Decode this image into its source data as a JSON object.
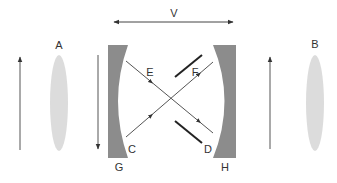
{
  "diagram": {
    "labels": {
      "velocity": "V",
      "lens_left": "A",
      "lens_right": "B",
      "ray_start_lower": "C",
      "ray_end_lower": "D",
      "ray_mid_upper_left": "E",
      "ray_mid_upper_right": "F",
      "mirror_left": "G",
      "mirror_right": "H"
    },
    "colors": {
      "mirror": "#8c8c8c",
      "lens": "#dcdcdc",
      "line": "#444444",
      "bar": "#222222"
    }
  }
}
